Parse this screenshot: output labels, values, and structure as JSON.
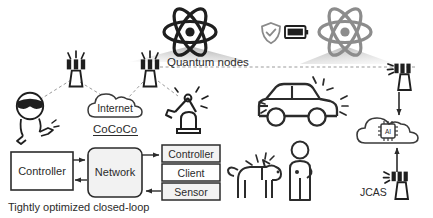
{
  "figure": {
    "background_color": "#ffffff",
    "stroke_color": "#2b2b2b",
    "muted_stroke_color": "#808080",
    "box_fill_color": "#f2f2f2"
  },
  "labels": {
    "quantum_nodes": "Quantum nodes",
    "internet": "Internet",
    "cococo": "CoCoCo",
    "jcas": "JCAS",
    "closed_loop": "Tightly optimized closed-loop"
  },
  "loop_diagram": {
    "controller_box": "Controller",
    "network_box": "Network",
    "stack": [
      {
        "label": "Controller"
      },
      {
        "label": "Client"
      },
      {
        "label": "Sensor"
      }
    ]
  },
  "icons": [
    {
      "name": "atom-icon-left",
      "tone": "dark"
    },
    {
      "name": "atom-icon-right",
      "tone": "light"
    },
    {
      "name": "shield-check-icon",
      "tone": "gray"
    },
    {
      "name": "battery-icon",
      "tone": "dark"
    },
    {
      "name": "cell-tower-icon-1",
      "tone": "dark"
    },
    {
      "name": "cell-tower-icon-2",
      "tone": "dark"
    },
    {
      "name": "cell-tower-icon-3",
      "tone": "dark"
    },
    {
      "name": "cell-tower-icon-4",
      "tone": "dark"
    },
    {
      "name": "vr-user-icon",
      "tone": "dark"
    },
    {
      "name": "cloud-internet-icon",
      "tone": "dark"
    },
    {
      "name": "robot-arm-icon",
      "tone": "dark"
    },
    {
      "name": "car-icon",
      "tone": "dark"
    },
    {
      "name": "dog-icon",
      "tone": "dark"
    },
    {
      "name": "person-icon",
      "tone": "dark"
    },
    {
      "name": "ai-cloud-icon",
      "tone": "dark"
    },
    {
      "name": "ai-chip-label",
      "text": "AI"
    }
  ],
  "chip": {
    "text": "AI"
  }
}
